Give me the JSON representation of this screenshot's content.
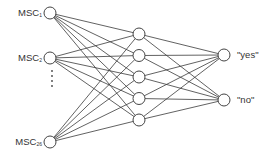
{
  "diagram": {
    "type": "neural-network",
    "colors": {
      "line": "#3a3a3a",
      "node_stroke": "#444444",
      "node_fill": "#ffffff",
      "text": "#333333"
    },
    "inputs": [
      {
        "prefix": "MSC",
        "sub": "1",
        "x": 50,
        "y": 13
      },
      {
        "prefix": "MSC",
        "sub": "2",
        "x": 50,
        "y": 58
      },
      {
        "prefix": "MSC",
        "sub": "26",
        "x": 50,
        "y": 142
      }
    ],
    "ellipsis_dots": [
      71,
      76,
      81,
      86
    ],
    "hidden": [
      {
        "x": 139,
        "y": 34
      },
      {
        "x": 139,
        "y": 55.5
      },
      {
        "x": 139,
        "y": 77
      },
      {
        "x": 139,
        "y": 98.5
      },
      {
        "x": 139,
        "y": 120
      }
    ],
    "outputs": [
      {
        "label": "\"yes\"",
        "x": 224,
        "y": 55
      },
      {
        "label": "\"no\"",
        "x": 224,
        "y": 100
      }
    ],
    "node_radius": 6
  }
}
